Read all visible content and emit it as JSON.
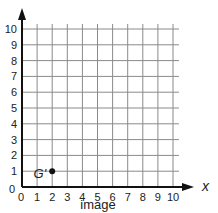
{
  "diagram": {
    "type": "coordinate-grid",
    "caption": "image",
    "x_axis": {
      "label": "x",
      "min": 0,
      "max": 10,
      "ticks": [
        "0",
        "1",
        "2",
        "3",
        "4",
        "5",
        "6",
        "7",
        "8",
        "9",
        "10"
      ]
    },
    "y_axis": {
      "label": "",
      "min": 0,
      "max": 10,
      "ticks": [
        "0",
        "1",
        "2",
        "3",
        "4",
        "5",
        "6",
        "7",
        "8",
        "9",
        "10"
      ]
    },
    "points": [
      {
        "label": "G'",
        "x": 2,
        "y": 1
      }
    ],
    "colors": {
      "grid": "#8a8a8a",
      "axis": "#111111",
      "point": "#111111",
      "background": "#ffffff"
    }
  }
}
